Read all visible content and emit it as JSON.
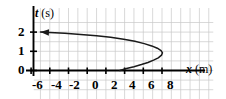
{
  "figure": {
    "name": "position-time-graph",
    "background_color": "#ffffff",
    "line_color": "#1a1a1a",
    "grid_color": "#c9c9c9",
    "axis_color": "#000000"
  },
  "chart_data": {
    "type": "line",
    "title": "",
    "xlabel_var": "x",
    "xlabel_unit": "(m)",
    "ylabel_var": "t",
    "ylabel_unit": "(s)",
    "xlabel": "x (m)",
    "ylabel": "t (s)",
    "xlim": [
      -7.5,
      10.5
    ],
    "ylim": [
      -0.6,
      2.6
    ],
    "xticks": [
      -6,
      -4,
      -2,
      0,
      2,
      4,
      6,
      8
    ],
    "yticks": [
      0,
      1,
      2
    ],
    "xtick_labels": [
      "-6",
      "-4",
      "-2",
      "0",
      "2",
      "4",
      "6",
      "8"
    ],
    "ytick_labels": [
      "0",
      "1",
      "2"
    ],
    "x_minor_step": 1,
    "y_minor_step": 0.5,
    "grid": true,
    "legend": false,
    "arrow_direction": "left",
    "arrow_tip": {
      "x": -5.0,
      "t": 2.0
    },
    "series": [
      {
        "name": "trajectory",
        "comment": "t as parametric function of x; lower branch rises from x=3.5,t=0 to vertex, upper branch returns left to arrow tip",
        "points": [
          {
            "x": 3.5,
            "t": 0.0
          },
          {
            "x": 4.2,
            "t": 0.1
          },
          {
            "x": 5.0,
            "t": 0.2
          },
          {
            "x": 5.8,
            "t": 0.31
          },
          {
            "x": 6.5,
            "t": 0.42
          },
          {
            "x": 7.1,
            "t": 0.54
          },
          {
            "x": 7.6,
            "t": 0.66
          },
          {
            "x": 7.95,
            "t": 0.8
          },
          {
            "x": 8.05,
            "t": 0.92
          },
          {
            "x": 7.9,
            "t": 1.04
          },
          {
            "x": 7.5,
            "t": 1.16
          },
          {
            "x": 6.9,
            "t": 1.28
          },
          {
            "x": 6.1,
            "t": 1.4
          },
          {
            "x": 5.1,
            "t": 1.52
          },
          {
            "x": 3.9,
            "t": 1.63
          },
          {
            "x": 2.5,
            "t": 1.73
          },
          {
            "x": 1.0,
            "t": 1.81
          },
          {
            "x": -0.7,
            "t": 1.88
          },
          {
            "x": -2.4,
            "t": 1.94
          },
          {
            "x": -4.0,
            "t": 1.98
          },
          {
            "x": -5.0,
            "t": 2.0
          }
        ]
      }
    ]
  }
}
